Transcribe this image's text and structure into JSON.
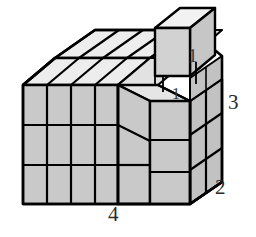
{
  "figure": {
    "kind": "isometric-block-diagram",
    "colors": {
      "background": "#ffffff",
      "front_face": "#c9c9c9",
      "side_face": "#c2c2c2",
      "top_face": "#ededed",
      "notch_floor": "#d8d8d8",
      "cube_front": "#d2d2d2",
      "cube_side": "#c6c6c6",
      "cube_top": "#f2f2f2",
      "outline": "#000000",
      "label_text": "#2b2b2b"
    },
    "grid": {
      "columns": 4,
      "depth": 2,
      "rows": 3
    }
  },
  "labels": {
    "width": "4",
    "depth": "2",
    "height": "3",
    "unit_cube": "1",
    "notch_depth": "1"
  }
}
